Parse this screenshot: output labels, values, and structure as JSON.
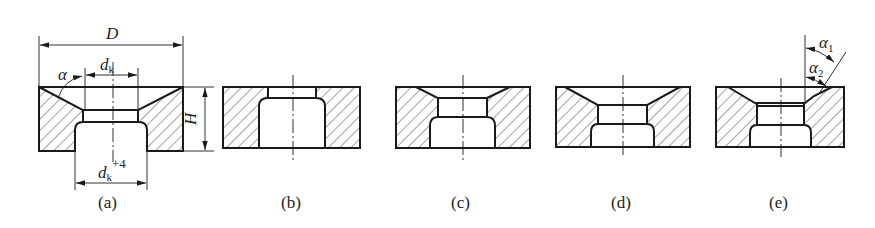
{
  "figure": {
    "panels": [
      {
        "id": "a",
        "caption": "(a)"
      },
      {
        "id": "b",
        "caption": "(b)"
      },
      {
        "id": "c",
        "caption": "(c)"
      },
      {
        "id": "d",
        "caption": "(d)"
      },
      {
        "id": "e",
        "caption": "(e)"
      }
    ],
    "dimensions": {
      "outer_diameter": "D",
      "height": "H",
      "bore_base": "d",
      "bore_sub": "k",
      "bore2_sup": "+4",
      "angle": "α",
      "angle1": "α",
      "angle1_sub": "1",
      "angle2": "α",
      "angle2_sub": "2"
    },
    "colors": {
      "line": "#1a1a1a",
      "background": "#ffffff"
    }
  }
}
